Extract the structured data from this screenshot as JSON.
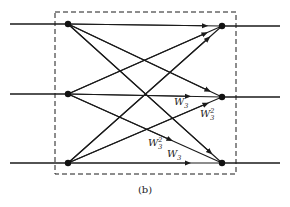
{
  "diagram": {
    "caption": "(b)",
    "nodes": {
      "left": [
        {
          "id": "L0",
          "x": 68,
          "y": 24
        },
        {
          "id": "L1",
          "x": 68,
          "y": 94
        },
        {
          "id": "L2",
          "x": 68,
          "y": 163
        }
      ],
      "right": [
        {
          "id": "R0",
          "x": 222,
          "y": 26
        },
        {
          "id": "R1",
          "x": 222,
          "y": 97
        },
        {
          "id": "R2",
          "x": 222,
          "y": 163
        }
      ]
    },
    "edges": [
      [
        "L0",
        "R0"
      ],
      [
        "L0",
        "R1"
      ],
      [
        "L0",
        "R2"
      ],
      [
        "L1",
        "R0"
      ],
      [
        "L1",
        "R1"
      ],
      [
        "L1",
        "R2"
      ],
      [
        "L2",
        "R0"
      ],
      [
        "L2",
        "R1"
      ],
      [
        "L2",
        "R2"
      ]
    ],
    "labels": [
      {
        "base": "W",
        "sub": "3",
        "sup": "",
        "x": 174,
        "y": 97
      },
      {
        "base": "W",
        "sub": "3",
        "sup": "2",
        "x": 200,
        "y": 108
      },
      {
        "base": "W",
        "sub": "3",
        "sup": "2",
        "x": 148,
        "y": 137
      },
      {
        "base": "W",
        "sub": "3",
        "sup": "",
        "x": 167,
        "y": 149
      }
    ],
    "dashed_box": {
      "x": 55,
      "y": 12,
      "width": 181,
      "height": 162
    },
    "stroke_color": "#1a1a1a"
  }
}
